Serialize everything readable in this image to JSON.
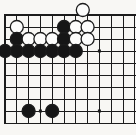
{
  "board": {
    "game": "go",
    "kind": "printed-diagram",
    "region": "top-left-corner",
    "bg_color": "#f8f7f4",
    "line_color": "#1c1c1c",
    "grid": {
      "cols": 12,
      "rows": 10,
      "origin_x": 5,
      "origin_y": 15,
      "pitch_x": 11.8,
      "pitch_y": 12,
      "edge_top": true,
      "edge_left": true,
      "edge_right": false,
      "edge_bottom": false,
      "edge_line_width": 1.8,
      "inner_line_width": 1,
      "canvas_width": 136,
      "canvas_height": 135
    },
    "stone": {
      "radius": 6.5,
      "black_fill": "#161616",
      "white_fill": "#fcfcfb",
      "outline_color": "#1c1c1c",
      "outline_width": 1.3
    },
    "stones": [
      {
        "col": 2,
        "row": 2,
        "color": "white"
      },
      {
        "col": 6,
        "row": 2,
        "color": "black"
      },
      {
        "col": 7,
        "row": 2,
        "color": "white"
      },
      {
        "col": 8,
        "row": 2,
        "color": "white"
      },
      {
        "col": 7,
        "row": 1,
        "color": "white",
        "dx": 7,
        "dy": -5
      },
      {
        "col": 2,
        "row": 3,
        "color": "black"
      },
      {
        "col": 3,
        "row": 3,
        "color": "white"
      },
      {
        "col": 4,
        "row": 3,
        "color": "white"
      },
      {
        "col": 5,
        "row": 3,
        "color": "white"
      },
      {
        "col": 6,
        "row": 3,
        "color": "black"
      },
      {
        "col": 7,
        "row": 3,
        "color": "white"
      },
      {
        "col": 8,
        "row": 3,
        "color": "white"
      },
      {
        "col": 1,
        "row": 4,
        "color": "black"
      },
      {
        "col": 2,
        "row": 4,
        "color": "black"
      },
      {
        "col": 3,
        "row": 4,
        "color": "black"
      },
      {
        "col": 4,
        "row": 4,
        "color": "black"
      },
      {
        "col": 5,
        "row": 4,
        "color": "black"
      },
      {
        "col": 6,
        "row": 4,
        "color": "black"
      },
      {
        "col": 7,
        "row": 4,
        "color": "black"
      },
      {
        "col": 3,
        "row": 9,
        "color": "black"
      },
      {
        "col": 5,
        "row": 9,
        "color": "black"
      }
    ],
    "star_points": [
      {
        "col": 4,
        "row": 9
      },
      {
        "col": 9,
        "row": 9
      },
      {
        "col": 9,
        "row": 4
      }
    ],
    "star_point_size": 3
  }
}
